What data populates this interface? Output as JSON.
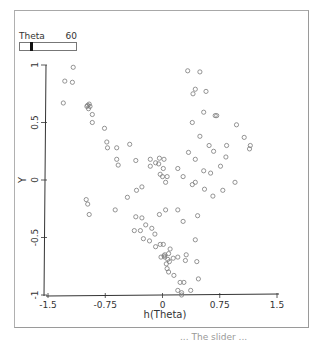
{
  "slider": {
    "label": "Theta",
    "value": "60",
    "position_fraction": 0.2,
    "icon": "slider-thumb"
  },
  "chart_data": {
    "type": "scatter",
    "title": "",
    "xlabel": "h(Theta)",
    "ylabel": "Y",
    "xlim": [
      -1.5,
      1.5
    ],
    "ylim": [
      -1,
      1
    ],
    "xticks": [
      "-1.5",
      "-0.75",
      "0",
      "0.75",
      "1.5"
    ],
    "yticks": [
      "-1",
      "-0.5",
      "0",
      "0.5",
      "1"
    ],
    "grid": false,
    "legend": null,
    "marker": "open-circle",
    "points": [
      [
        -1.17,
        0.98
      ],
      [
        -1.28,
        0.86
      ],
      [
        -1.18,
        0.85
      ],
      [
        -1.3,
        0.67
      ],
      [
        -0.96,
        0.66
      ],
      [
        -0.98,
        0.65
      ],
      [
        -0.99,
        0.64
      ],
      [
        -0.95,
        0.64
      ],
      [
        -0.97,
        0.62
      ],
      [
        -0.92,
        0.57
      ],
      [
        -0.92,
        0.5
      ],
      [
        -0.76,
        0.45
      ],
      [
        -0.73,
        0.33
      ],
      [
        -0.72,
        0.28
      ],
      [
        -0.6,
        0.28
      ],
      [
        -0.6,
        0.18
      ],
      [
        -0.43,
        0.31
      ],
      [
        -0.58,
        0.13
      ],
      [
        -0.35,
        0.17
      ],
      [
        -0.16,
        0.12
      ],
      [
        -0.16,
        0.18
      ],
      [
        -0.09,
        0.15
      ],
      [
        -0.04,
        0.19
      ],
      [
        -0.05,
        0.14
      ],
      [
        0.02,
        0.18
      ],
      [
        0.01,
        0.1
      ],
      [
        -0.03,
        0.05
      ],
      [
        0.0,
        0.03
      ],
      [
        0.04,
        -0.02
      ],
      [
        0.06,
        0.03
      ],
      [
        0.2,
        0.1
      ],
      [
        0.27,
        0.03
      ],
      [
        0.43,
        -0.02
      ],
      [
        0.54,
        0.08
      ],
      [
        0.63,
        0.06
      ],
      [
        0.76,
        0.12
      ],
      [
        0.39,
        -0.04
      ],
      [
        0.33,
        0.95
      ],
      [
        0.4,
        0.75
      ],
      [
        0.49,
        0.94
      ],
      [
        0.57,
        0.77
      ],
      [
        0.43,
        0.79
      ],
      [
        0.54,
        0.59
      ],
      [
        0.49,
        0.38
      ],
      [
        0.61,
        0.3
      ],
      [
        0.39,
        0.5
      ],
      [
        0.69,
        0.56
      ],
      [
        0.71,
        0.56
      ],
      [
        0.34,
        0.24
      ],
      [
        0.43,
        0.18
      ],
      [
        0.67,
        0.25
      ],
      [
        0.84,
        0.3
      ],
      [
        0.97,
        0.48
      ],
      [
        1.07,
        0.37
      ],
      [
        1.14,
        0.27
      ],
      [
        1.15,
        0.3
      ],
      [
        0.95,
        -0.02
      ],
      [
        0.83,
        0.2
      ],
      [
        0.79,
        -0.09
      ],
      [
        0.66,
        -0.14
      ],
      [
        0.55,
        -0.08
      ],
      [
        -1.0,
        -0.17
      ],
      [
        -0.98,
        -0.21
      ],
      [
        -0.96,
        -0.3
      ],
      [
        -0.62,
        -0.26
      ],
      [
        -0.46,
        -0.15
      ],
      [
        -0.34,
        -0.09
      ],
      [
        -0.27,
        -0.06
      ],
      [
        -0.35,
        -0.32
      ],
      [
        -0.27,
        -0.33
      ],
      [
        -0.22,
        -0.39
      ],
      [
        -0.37,
        -0.44
      ],
      [
        -0.29,
        -0.44
      ],
      [
        -0.14,
        -0.42
      ],
      [
        -0.17,
        -0.53
      ],
      [
        -0.25,
        -0.51
      ],
      [
        -0.1,
        -0.47
      ],
      [
        -0.09,
        -0.58
      ],
      [
        -0.03,
        -0.56
      ],
      [
        0.01,
        -0.56
      ],
      [
        -0.04,
        -0.3
      ],
      [
        0.04,
        -0.26
      ],
      [
        0.2,
        -0.26
      ],
      [
        0.27,
        -0.36
      ],
      [
        0.46,
        -0.31
      ],
      [
        0.1,
        -0.6
      ],
      [
        0.08,
        -0.64
      ],
      [
        0.03,
        -0.65
      ],
      [
        0.02,
        -0.66
      ],
      [
        -0.02,
        -0.67
      ],
      [
        0.03,
        -0.67
      ],
      [
        0.07,
        -0.69
      ],
      [
        0.09,
        -0.71
      ],
      [
        0.14,
        -0.68
      ],
      [
        0.05,
        -0.73
      ],
      [
        0.06,
        -0.77
      ],
      [
        0.08,
        -0.8
      ],
      [
        0.2,
        -0.67
      ],
      [
        0.3,
        -0.7
      ],
      [
        0.31,
        -0.65
      ],
      [
        0.45,
        -0.71
      ],
      [
        0.43,
        -0.52
      ],
      [
        0.15,
        -0.83
      ],
      [
        0.23,
        -0.89
      ],
      [
        0.28,
        -0.89
      ],
      [
        0.47,
        -0.86
      ],
      [
        0.2,
        -0.96
      ],
      [
        0.25,
        -0.98
      ],
      [
        0.37,
        -0.96
      ],
      [
        0.25,
        -1.0
      ]
    ]
  },
  "footer": {
    "clipped_text": "...  The slider ..."
  }
}
